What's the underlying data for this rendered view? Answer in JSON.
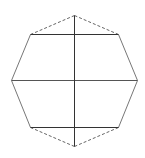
{
  "diagram": {
    "title": "",
    "shape": "octagon",
    "background": "#ffffff",
    "vertices": {
      "top": [
        74,
        15
      ],
      "upper_right": [
        118,
        34
      ],
      "right": [
        137,
        80
      ],
      "lower_right": [
        118,
        127
      ],
      "bottom": [
        74,
        146
      ],
      "lower_left": [
        30,
        127
      ],
      "left": [
        11,
        80
      ],
      "upper_left": [
        30,
        34
      ]
    },
    "edges": [
      {
        "name": "top-left-edge",
        "from": "top",
        "to": "upper_left",
        "style": "dashed",
        "color": "#666666"
      },
      {
        "name": "top-right-edge",
        "from": "top",
        "to": "upper_right",
        "style": "dashed",
        "color": "#666666"
      },
      {
        "name": "upper-right-side-edge",
        "from": "upper_right",
        "to": "right",
        "style": "solid",
        "color": "#777777"
      },
      {
        "name": "lower-right-side-edge",
        "from": "right",
        "to": "lower_right",
        "style": "solid",
        "color": "#777777"
      },
      {
        "name": "bottom-right-edge",
        "from": "lower_right",
        "to": "bottom",
        "style": "dashed",
        "color": "#666666"
      },
      {
        "name": "bottom-left-edge",
        "from": "bottom",
        "to": "lower_left",
        "style": "dashed",
        "color": "#666666"
      },
      {
        "name": "lower-left-side-edge",
        "from": "lower_left",
        "to": "left",
        "style": "solid",
        "color": "#777777"
      },
      {
        "name": "upper-left-side-edge",
        "from": "left",
        "to": "upper_left",
        "style": "solid",
        "color": "#777777"
      }
    ],
    "inner_lines": [
      {
        "name": "upper-horizontal-line",
        "from": "upper_left",
        "to": "upper_right",
        "style": "solid",
        "color": "#333333"
      },
      {
        "name": "middle-horizontal-line",
        "from": "left",
        "to": "right",
        "style": "solid",
        "color": "#555555"
      },
      {
        "name": "lower-horizontal-line",
        "from": "lower_left",
        "to": "lower_right",
        "style": "solid",
        "color": "#333333"
      },
      {
        "name": "vertical-axis-line",
        "from": "top",
        "to": "bottom",
        "style": "solid",
        "color": "#333333"
      }
    ]
  }
}
